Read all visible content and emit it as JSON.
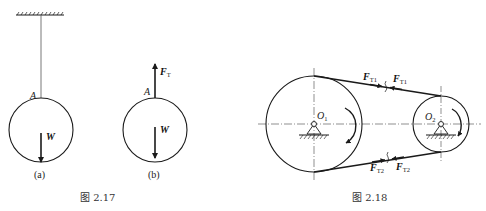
{
  "figure_2_17": {
    "caption": "图 2.17",
    "panel_a": {
      "label": "(a)",
      "point_label": "A",
      "force_weight": "W"
    },
    "panel_b": {
      "label": "(b)",
      "point_label": "A",
      "force_tension": "F",
      "force_tension_sub": "T",
      "force_weight": "W"
    }
  },
  "figure_2_18": {
    "caption": "图 2.18",
    "pulley_1": {
      "label": "O",
      "sub": "1"
    },
    "pulley_2": {
      "label": "O",
      "sub": "2"
    },
    "upper_belt": {
      "left_force": "F",
      "left_force_sub": "T1",
      "right_force": "F",
      "right_force_sub": "T1"
    },
    "lower_belt": {
      "left_force": "F",
      "left_force_sub": "T2",
      "right_force": "F",
      "right_force_sub": "T2"
    }
  },
  "colors": {
    "stroke": "#1a1a1a",
    "text": "#222222",
    "background": "#ffffff"
  }
}
